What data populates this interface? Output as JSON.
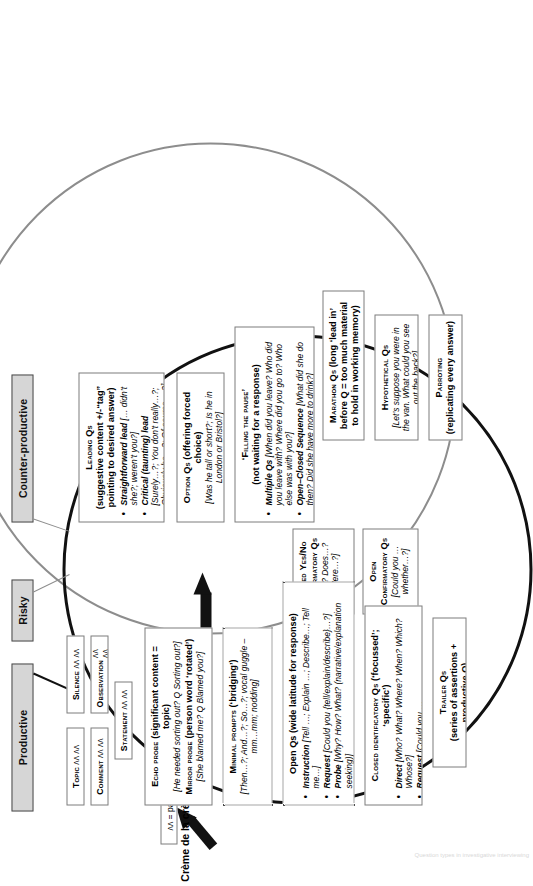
{
  "figure": {
    "title": "Question types in investigative interviewing",
    "legend_creme": "Crème de la crème Qs",
    "legend_pause": "ʌʌ = pause",
    "pause_mark": "ʌʌ ʌʌ"
  },
  "banners": {
    "counter_productive": "Counter-productive",
    "risky": "Risky",
    "productive": "Productive"
  },
  "counter_productive": {
    "leading": {
      "title_sc": "Leading Qs",
      "title_bold": "(suggestive content +/-“tag” pointing to desired answer)",
      "bullets": [
        {
          "bold": "Straightforward lead",
          "rest": " [… didn’t she?; weren’t you?]"
        },
        {
          "bold": "Critical (taunting) lead",
          "rest": " [Surely…?; You don’t really…?; Obviously he…?; Of course …?]"
        }
      ]
    },
    "option": {
      "title_sc": "Option Qs",
      "title_bold": " (offering forced choice)",
      "example": "[Was he tall or short?; Is he in London or Bristol?]"
    },
    "filling": {
      "title_sc": "‘Filling the pause’",
      "title_bold": "(not waiting for a response)",
      "bullets": [
        {
          "bold": "Multiple Qs",
          "rest": " [When did you leave? Who did you leave with? Where did you go to? Who else was with you?]"
        },
        {
          "bold": "Open–Closed Sequence",
          "rest": " [What did she do then? Did she have more to drink?]"
        }
      ]
    },
    "marathon": {
      "title_sc": "Marathon Qs",
      "title_bold": " (long ‘lead in’ before Q = too much material to hold in working memory)"
    },
    "hypothetical": {
      "title_sc": "Hypothetical Qs",
      "example": "[Let’s suppose you were in the van. What could you see out the back?]"
    },
    "parroting": {
      "title_sc": "Parroting",
      "title_bold": "(replicating every answer)"
    }
  },
  "risky": {
    "closed_yes_no": {
      "title_sc": "Closed Yes/No Confirmatory Qs",
      "example": "[Is…? Does…? Were…?]"
    },
    "open_confirmatory": {
      "title_sc": "Open Confirmatory Qs",
      "example": "[Could you … whether…?]"
    }
  },
  "productive": {
    "minor_boxes": [
      {
        "label_sc": "Silence",
        "marks": "ʌʌ ʌʌ"
      },
      {
        "label_sc": "Observation",
        "marks": "ʌʌ ʌʌ"
      },
      {
        "label_sc": "Topic",
        "marks": "ʌʌ ʌʌ"
      },
      {
        "label_sc": "Comment",
        "marks": "ʌʌ ʌʌ"
      },
      {
        "label_sc": "Statement",
        "marks": "ʌʌ ʌʌ"
      }
    ],
    "echo": {
      "title_sc": "Echo probe",
      "title_bold": " (significant content = topic)",
      "example1": "[He needed sorting out? Q Sorting out?]",
      "sub_sc": "Mirror probe",
      "sub_bold": " (person word ‘rotated’)",
      "example2": "[She blamed me? Q Blamed you?]"
    },
    "minimal": {
      "title_sc": "Minimal prompts",
      "title_bold": " (‘bridging’)",
      "example": "[Then…?; And…?; So…?; vocal guggle – mm…mm; nodding]"
    },
    "open": {
      "title_bold": "Open Qs (wide latitude for response)",
      "bullets": [
        {
          "bold": "Instruction",
          "rest": " [Tell …; Explain …; Describe…; Tell me…]"
        },
        {
          "bold": "Request",
          "rest": " [Could you {tell/explain/describe}…?]"
        },
        {
          "bold": "Probe",
          "rest": " [Why? How? What? (narrative/explanation seeking)]"
        },
        {
          "bold": "Parameter",
          "rest": " [What… between (point X)… and (point Y)?]"
        }
      ]
    },
    "closed_identificatory": {
      "title_sc": "Closed identificatory Qs",
      "title_bold": " (‘focussed’; ‘specific’)",
      "bullets": [
        {
          "bold": "Direct",
          "rest": " [Who? What? Where? When? Which? Whose?]"
        },
        {
          "bold": "Request",
          "rest": " [Could you … {say/tell/explain/describe} {who/what/where/when/which}…?]"
        }
      ]
    },
    "trailer": {
      "title_sc": "Trailer Qs",
      "title_bold": "(series of assertions + productive Q)"
    }
  },
  "colors": {
    "banner_fill": "#d6d6d6",
    "banner_border": "#4a4a4a",
    "circle_grey": "#8d8d8d",
    "circle_black": "#111111",
    "box_border": "#7c7c7c"
  }
}
